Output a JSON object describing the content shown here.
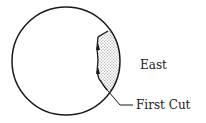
{
  "diagram": {
    "labels": {
      "east": "East",
      "first_cut": "First Cut"
    },
    "colors": {
      "stroke": "#1a1a1a",
      "shading": "#bbbbbb",
      "background": "#ffffff"
    }
  }
}
